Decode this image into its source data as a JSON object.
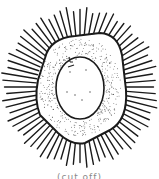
{
  "figure": {
    "center": [
      80,
      87
    ],
    "spine_count": 72,
    "spine_inner_radius": 48,
    "spine_outer_radius": 78,
    "colors": {
      "ink": "#1a1a1a",
      "background": "#ffffff",
      "stipple": "#333333"
    }
  },
  "caption": {
    "text": "(cut off)"
  }
}
